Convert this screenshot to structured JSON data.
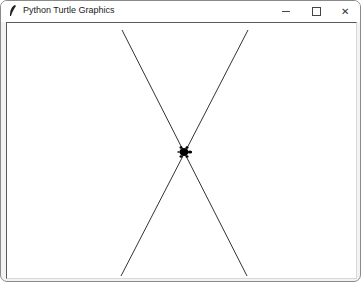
{
  "window": {
    "title": "Python Turtle Graphics",
    "icon": "feather-icon",
    "controls": {
      "minimize": "minimize-icon",
      "maximize": "maximize-icon",
      "close": "close-icon",
      "close_glyph": "✕"
    }
  },
  "canvas": {
    "background": "#ffffff",
    "line_color": "#333333",
    "lines": [
      {
        "x1": 115,
        "y1": 7,
        "x2": 240,
        "y2": 253
      },
      {
        "x1": 241,
        "y1": 7,
        "x2": 114,
        "y2": 253
      }
    ],
    "turtle": {
      "x": 177,
      "y": 129,
      "heading": 0,
      "color": "#000000",
      "shape": "turtle"
    }
  }
}
